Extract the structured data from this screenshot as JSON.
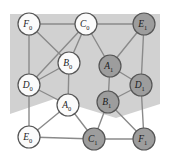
{
  "figure": {
    "kind": "graph-diagram",
    "width": 170,
    "height": 161,
    "background_color": "#ffffff"
  },
  "plane": {
    "name": "shaded-plane",
    "fill_color": "#c9c9c9",
    "opacity": 0.85,
    "points": "10,14 160,14 160,104 116,118 54,99 10,114"
  },
  "palette": {
    "node_light_fill": "#fbfbfb",
    "node_dark_fill": "#9d9d9d",
    "node_stroke": "#555555",
    "edge_color": "#8a8a8a",
    "label_color": "#1b1b1b"
  },
  "nodes": [
    {
      "id": "F0",
      "letter": "F",
      "sub": "0",
      "x": 29,
      "y": 24,
      "r": 11,
      "shade": "light"
    },
    {
      "id": "C0",
      "letter": "C",
      "sub": "0",
      "x": 86,
      "y": 24,
      "r": 11,
      "shade": "light"
    },
    {
      "id": "E1",
      "letter": "E",
      "sub": "1",
      "x": 144,
      "y": 24,
      "r": 11,
      "shade": "dark"
    },
    {
      "id": "B0",
      "letter": "B",
      "sub": "0",
      "x": 69,
      "y": 63,
      "r": 11,
      "shade": "light"
    },
    {
      "id": "A1",
      "letter": "A",
      "sub": "1",
      "x": 110,
      "y": 66,
      "r": 11,
      "shade": "dark"
    },
    {
      "id": "D0",
      "letter": "D",
      "sub": "0",
      "x": 29,
      "y": 85,
      "r": 11,
      "shade": "light"
    },
    {
      "id": "D1",
      "letter": "D",
      "sub": "1",
      "x": 141,
      "y": 85,
      "r": 11,
      "shade": "dark"
    },
    {
      "id": "A0",
      "letter": "A",
      "sub": "0",
      "x": 68,
      "y": 105,
      "r": 11,
      "shade": "light"
    },
    {
      "id": "B1",
      "letter": "B",
      "sub": "1",
      "x": 108,
      "y": 102,
      "r": 11,
      "shade": "dark"
    },
    {
      "id": "E0",
      "letter": "E",
      "sub": "0",
      "x": 29,
      "y": 137,
      "r": 11,
      "shade": "light"
    },
    {
      "id": "C1",
      "letter": "C",
      "sub": "1",
      "x": 94,
      "y": 139,
      "r": 11,
      "shade": "dark"
    },
    {
      "id": "F1",
      "letter": "F",
      "sub": "1",
      "x": 144,
      "y": 139,
      "r": 11,
      "shade": "dark"
    }
  ],
  "edges": [
    {
      "from": "F0",
      "to": "C0"
    },
    {
      "from": "C0",
      "to": "E1"
    },
    {
      "from": "F0",
      "to": "D0"
    },
    {
      "from": "F0",
      "to": "B0"
    },
    {
      "from": "C0",
      "to": "B0"
    },
    {
      "from": "C0",
      "to": "D0"
    },
    {
      "from": "C0",
      "to": "A1"
    },
    {
      "from": "E1",
      "to": "A1"
    },
    {
      "from": "E1",
      "to": "D1"
    },
    {
      "from": "B0",
      "to": "D0"
    },
    {
      "from": "B0",
      "to": "A0"
    },
    {
      "from": "A1",
      "to": "D1"
    },
    {
      "from": "A1",
      "to": "B1"
    },
    {
      "from": "D0",
      "to": "E0"
    },
    {
      "from": "D0",
      "to": "A0"
    },
    {
      "from": "D1",
      "to": "B1"
    },
    {
      "from": "D1",
      "to": "F1"
    },
    {
      "from": "A0",
      "to": "E0"
    },
    {
      "from": "A0",
      "to": "C1"
    },
    {
      "from": "B1",
      "to": "C1"
    },
    {
      "from": "B1",
      "to": "F1"
    },
    {
      "from": "E0",
      "to": "C1"
    },
    {
      "from": "C1",
      "to": "F1"
    }
  ]
}
